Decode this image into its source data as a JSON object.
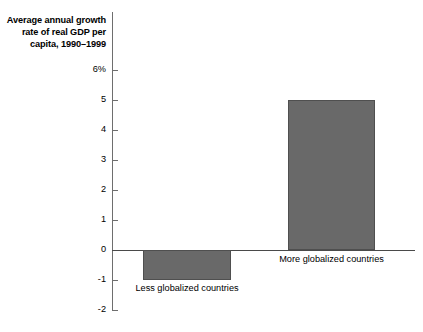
{
  "chart_data": {
    "type": "bar",
    "title": "Average annual growth\nrate of real GDP per\ncapita, 1990–1999",
    "xlabel": "",
    "ylabel": "",
    "categories": [
      "Less globalized countries",
      "More globalized countries"
    ],
    "values": [
      -1.0,
      5.0
    ],
    "ylim": [
      -2,
      6
    ],
    "yticks": [
      6,
      5,
      4,
      3,
      2,
      1,
      0,
      -1,
      -2
    ],
    "ytick_labels": [
      "6%",
      "5",
      "4",
      "3",
      "2",
      "1",
      "0",
      "-1",
      "-2"
    ],
    "grid": false,
    "legend": null,
    "bar_color": "#696969",
    "bar_edge_color": "#4f4f4f",
    "axis_color": "#6e6e6e",
    "zero_line_color": "#4a4a4a",
    "background": "#ffffff"
  }
}
